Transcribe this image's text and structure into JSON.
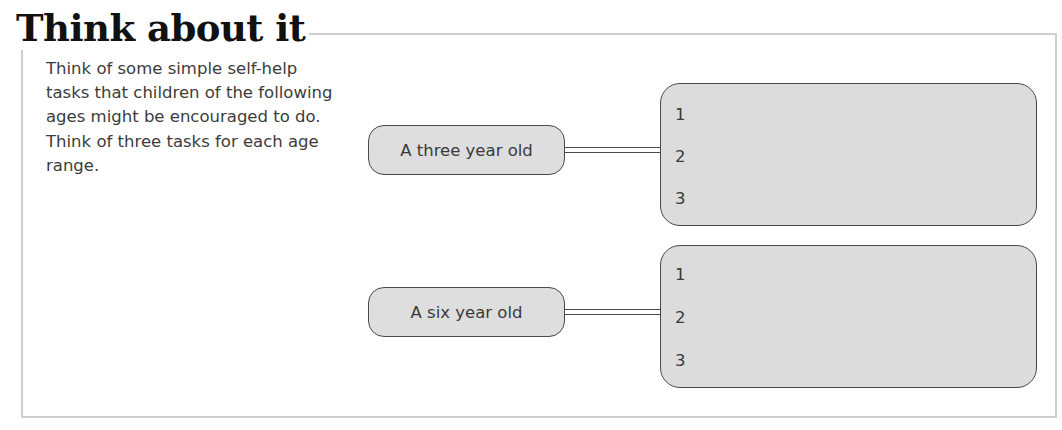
{
  "title": "Think about it",
  "intro": "Think of some simple self-help tasks that children of the following ages might be encouraged to do. Think of three tasks for each age range.",
  "groups": [
    {
      "label": "A three year old",
      "rows": [
        "1",
        "2",
        "3"
      ]
    },
    {
      "label": "A six year old",
      "rows": [
        "1",
        "2",
        "3"
      ]
    }
  ],
  "colors": {
    "panel_fill": "#dcdcdc",
    "outline": "#4a4a4a",
    "frame": "#cfcfcf",
    "title": "#111111"
  }
}
